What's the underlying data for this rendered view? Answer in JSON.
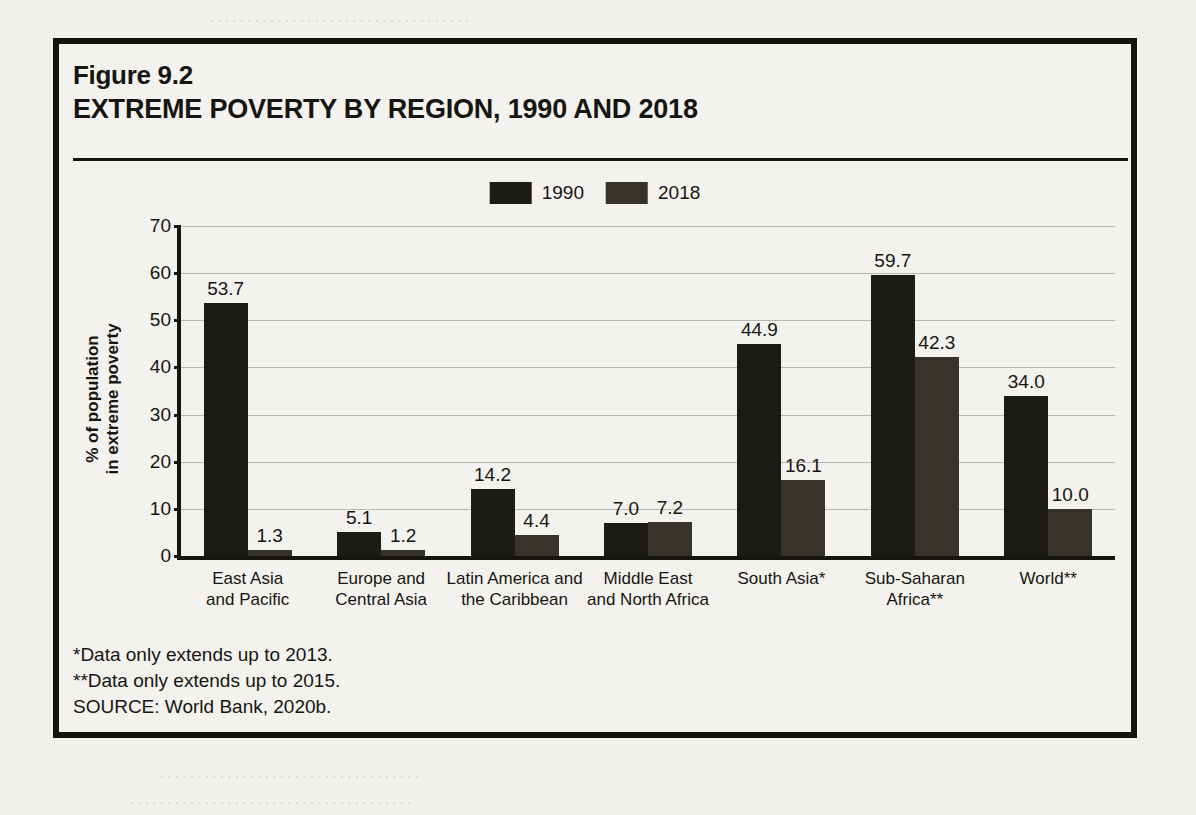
{
  "figure": {
    "number": "Figure 9.2",
    "title": "EXTREME POVERTY BY REGION, 1990 AND 2018"
  },
  "notes": {
    "note1": "*Data only extends up to 2013.",
    "note2": "**Data only extends up to 2015.",
    "source": "SOURCE: World Bank, 2020b."
  },
  "colors": {
    "series_1990": "#1d1b16",
    "series_2018": "#36332c",
    "frame": "#16140f",
    "background": "#f4f2ee",
    "gridline": "#b9b7b2"
  },
  "chart_data": {
    "type": "bar",
    "title": "EXTREME POVERTY BY REGION, 1990 AND 2018",
    "subtitle": "Figure 9.2",
    "xlabel": "",
    "ylabel": "% of population\nin extreme poverty",
    "ylabel_line1": "% of population",
    "ylabel_line2": "in extreme poverty",
    "ylim": [
      0,
      70
    ],
    "yticks": [
      0,
      10,
      20,
      30,
      40,
      50,
      60,
      70
    ],
    "ytick_labels": [
      "0",
      "10",
      "20",
      "30",
      "40",
      "50",
      "60",
      "70"
    ],
    "grid": true,
    "legend_position": "top-center",
    "categories": [
      "East Asia\nand Pacific",
      "Europe and\nCentral Asia",
      "Latin America and\nthe Caribbean",
      "Middle East\nand North Africa",
      "South Asia*",
      "Sub-Saharan\nAfrica**",
      "World**"
    ],
    "category_lines": [
      [
        "East Asia",
        "and Pacific"
      ],
      [
        "Europe and",
        "Central Asia"
      ],
      [
        "Latin America and",
        "the Caribbean"
      ],
      [
        "Middle East",
        "and North Africa"
      ],
      [
        "South Asia*",
        ""
      ],
      [
        "Sub-Saharan",
        "Africa**"
      ],
      [
        "World**",
        ""
      ]
    ],
    "series": [
      {
        "name": "1990",
        "values": [
          53.7,
          5.1,
          14.2,
          7.0,
          44.9,
          59.7,
          34.0
        ],
        "labels": [
          "53.7",
          "5.1",
          "14.2",
          "7.0",
          "44.9",
          "59.7",
          "34.0"
        ]
      },
      {
        "name": "2018",
        "values": [
          1.3,
          1.2,
          4.4,
          7.2,
          16.1,
          42.3,
          10.0
        ],
        "labels": [
          "1.3",
          "1.2",
          "4.4",
          "7.2",
          "16.1",
          "42.3",
          "10.0"
        ]
      }
    ]
  }
}
